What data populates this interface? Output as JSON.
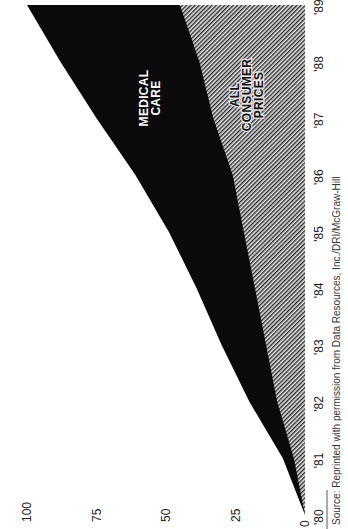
{
  "chart_data": {
    "type": "area",
    "orientation": "rotated-90-clockwise",
    "title": "",
    "xlabel": "",
    "ylabel": "",
    "categories": [
      "'80",
      "'81",
      "'82",
      "'83",
      "'84",
      "'85",
      "'86",
      "'87",
      "'88",
      "'89"
    ],
    "x": [
      1980,
      1981,
      1982,
      1983,
      1984,
      1985,
      1986,
      1987,
      1988,
      1989
    ],
    "ylim": [
      0,
      100
    ],
    "yticks": [
      "0",
      "25",
      "50",
      "75",
      "100"
    ],
    "grid": false,
    "legend": "inline-labels",
    "series": [
      {
        "name": "MEDICAL CARE",
        "label_lines": [
          "MEDICAL",
          "CARE"
        ],
        "fill": "#0a0a0a",
        "values": [
          0,
          8,
          20,
          30,
          39,
          49,
          61,
          75,
          88,
          100
        ]
      },
      {
        "name": "ALL CONSUMER PRICES",
        "label_lines": [
          "ALL",
          "CONSUMER",
          "PRICES"
        ],
        "fill": "hatched-gray",
        "values": [
          0,
          4,
          10,
          14,
          18,
          22,
          26,
          33,
          38,
          45
        ]
      }
    ],
    "source_note": "Source: Reprinted with permission from Data Resources, Inc./DRI/McGraw-Hill"
  },
  "colors": {
    "medical": "#0a0a0a",
    "hatch_dark": "#2a2a2a",
    "hatch_light": "#e8e8e8",
    "background": "#ffffff"
  }
}
